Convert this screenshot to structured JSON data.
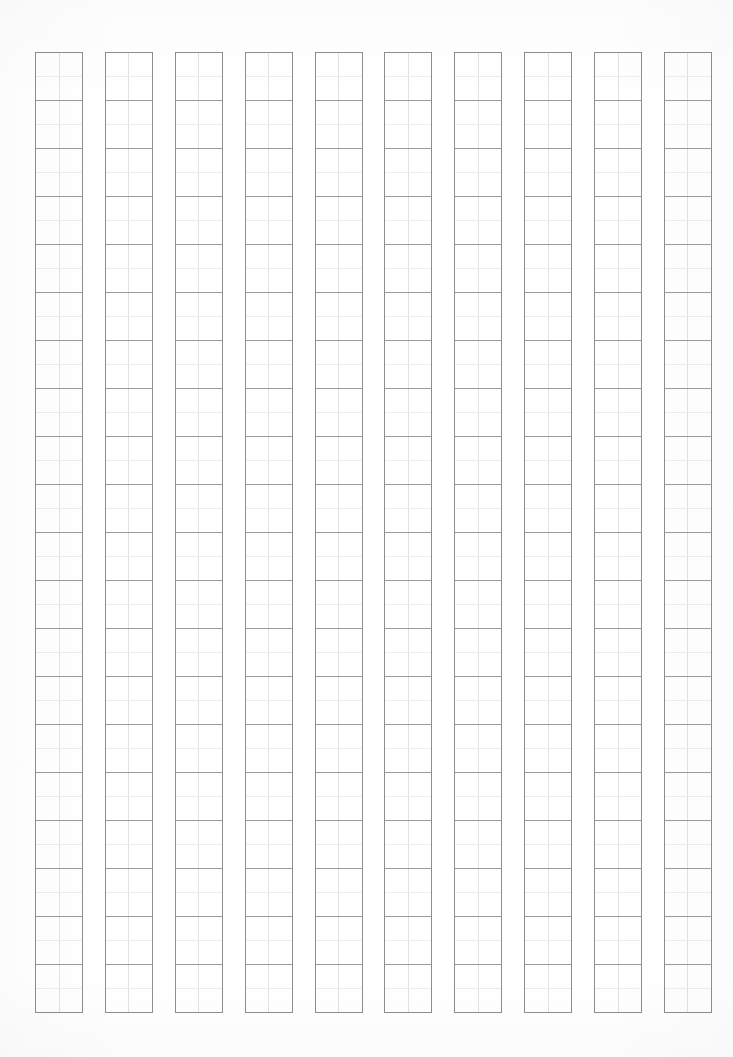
{
  "document": {
    "kind": "blank-manuscript-grid-sheet",
    "title": "",
    "orientation": "portrait",
    "background_color": "#ffffff"
  },
  "grid": {
    "columns": 10,
    "rows_per_column": 20,
    "cell_size_px": 48,
    "column_width_px": 48,
    "column_gap_px": 22,
    "grid_left_px": 35,
    "grid_top_px": 52,
    "grid_width_px": 677,
    "grid_height_px": 961,
    "outer_border_color": "#8e8e8e",
    "row_divider_color": "#9a9a9a",
    "cross_guide_vertical_color": "#e2e2e2",
    "cross_guide_horizontal_color": "#ececec",
    "has_center_crosshair": true,
    "reading_direction": "top-to-bottom, right-to-left"
  },
  "columns": [
    {
      "index": 1,
      "cells": [
        "",
        "",
        "",
        "",
        "",
        "",
        "",
        "",
        "",
        "",
        "",
        "",
        "",
        "",
        "",
        "",
        "",
        "",
        "",
        ""
      ]
    },
    {
      "index": 2,
      "cells": [
        "",
        "",
        "",
        "",
        "",
        "",
        "",
        "",
        "",
        "",
        "",
        "",
        "",
        "",
        "",
        "",
        "",
        "",
        "",
        ""
      ]
    },
    {
      "index": 3,
      "cells": [
        "",
        "",
        "",
        "",
        "",
        "",
        "",
        "",
        "",
        "",
        "",
        "",
        "",
        "",
        "",
        "",
        "",
        "",
        "",
        ""
      ]
    },
    {
      "index": 4,
      "cells": [
        "",
        "",
        "",
        "",
        "",
        "",
        "",
        "",
        "",
        "",
        "",
        "",
        "",
        "",
        "",
        "",
        "",
        "",
        "",
        ""
      ]
    },
    {
      "index": 5,
      "cells": [
        "",
        "",
        "",
        "",
        "",
        "",
        "",
        "",
        "",
        "",
        "",
        "",
        "",
        "",
        "",
        "",
        "",
        "",
        "",
        ""
      ]
    },
    {
      "index": 6,
      "cells": [
        "",
        "",
        "",
        "",
        "",
        "",
        "",
        "",
        "",
        "",
        "",
        "",
        "",
        "",
        "",
        "",
        "",
        "",
        "",
        ""
      ]
    },
    {
      "index": 7,
      "cells": [
        "",
        "",
        "",
        "",
        "",
        "",
        "",
        "",
        "",
        "",
        "",
        "",
        "",
        "",
        "",
        "",
        "",
        "",
        "",
        ""
      ]
    },
    {
      "index": 8,
      "cells": [
        "",
        "",
        "",
        "",
        "",
        "",
        "",
        "",
        "",
        "",
        "",
        "",
        "",
        "",
        "",
        "",
        "",
        "",
        "",
        ""
      ]
    },
    {
      "index": 9,
      "cells": [
        "",
        "",
        "",
        "",
        "",
        "",
        "",
        "",
        "",
        "",
        "",
        "",
        "",
        "",
        "",
        "",
        "",
        "",
        "",
        ""
      ]
    },
    {
      "index": 10,
      "cells": [
        "",
        "",
        "",
        "",
        "",
        "",
        "",
        "",
        "",
        "",
        "",
        "",
        "",
        "",
        "",
        "",
        "",
        "",
        "",
        ""
      ]
    }
  ],
  "margins": {
    "top_px": 52,
    "bottom_px": 44,
    "left_px": 35,
    "right_px": 21
  }
}
